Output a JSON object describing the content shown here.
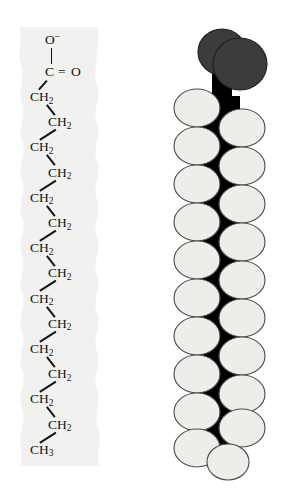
{
  "figure": {
    "background_color": "#ffffff"
  },
  "formula": {
    "band_color": "#f1f1ef",
    "bond_color": "#141414",
    "head_group": {
      "oxygen_anion": "O",
      "oxygen_anion_charge": "–",
      "carbon": "C",
      "double_bond_glyph": "=",
      "carbonyl_oxygen": "O"
    },
    "chain_labels": [
      {
        "text": "CH",
        "sub": "2",
        "side": "left"
      },
      {
        "text": "CH",
        "sub": "2",
        "side": "right"
      },
      {
        "text": "CH",
        "sub": "2",
        "side": "left"
      },
      {
        "text": "CH",
        "sub": "2",
        "side": "right"
      },
      {
        "text": "CH",
        "sub": "2",
        "side": "left"
      },
      {
        "text": "CH",
        "sub": "2",
        "side": "right"
      },
      {
        "text": "CH",
        "sub": "2",
        "side": "left"
      },
      {
        "text": "CH",
        "sub": "2",
        "side": "right"
      },
      {
        "text": "CH",
        "sub": "2",
        "side": "left"
      },
      {
        "text": "CH",
        "sub": "2",
        "side": "right"
      },
      {
        "text": "CH",
        "sub": "2",
        "side": "left"
      },
      {
        "text": "CH",
        "sub": "2",
        "side": "right"
      },
      {
        "text": "CH",
        "sub": "2",
        "side": "left"
      },
      {
        "text": "CH",
        "sub": "2",
        "side": "right"
      },
      {
        "text": "CH",
        "sub": "3",
        "side": "left"
      }
    ]
  },
  "model": {
    "oxygen_color": "#3c3c3c",
    "oxygen_outline": "#1d1d1d",
    "hydrogen_color": "#eeedea",
    "hydrogen_outline": "#4a4a4a",
    "carbon_backbone_color": "#000000",
    "oxygen_sphere_count": 2,
    "hydrogen_sphere_count": 31,
    "carbon_count": 16
  }
}
